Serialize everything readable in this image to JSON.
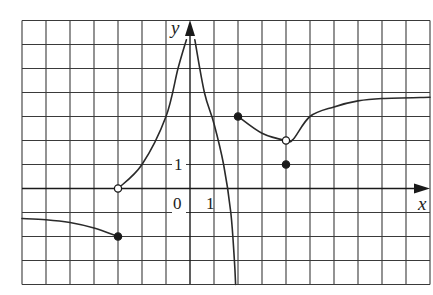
{
  "figure": {
    "type": "function-graph",
    "axes": {
      "x_label": "x",
      "y_label": "y",
      "origin_label": "0",
      "x_tick_label": "1",
      "y_tick_label": "1"
    },
    "grid": {
      "x_range": [
        -7,
        10
      ],
      "y_range": [
        -4,
        7
      ],
      "unit_px": 24,
      "origin_px": [
        190,
        188.5
      ]
    },
    "colors": {
      "grid": "#3a3a3a",
      "curve": "#2a2a2a",
      "background": "#ffffff"
    },
    "pieces": [
      {
        "name": "left-decreasing-branch",
        "domain": "x <= -3",
        "points": [
          [
            -7,
            -1.25
          ],
          [
            -6,
            -1.3
          ],
          [
            -5,
            -1.42
          ],
          [
            -4,
            -1.65
          ],
          [
            -3,
            -2
          ]
        ],
        "right_endpoint": {
          "x": -3,
          "y": -2,
          "type": "closed"
        }
      },
      {
        "name": "rising-branch-to-asymptote",
        "domain": "-3 < x < 0",
        "points": [
          [
            -3,
            0
          ],
          [
            -2,
            1
          ],
          [
            -1,
            3
          ],
          [
            -0.5,
            5
          ],
          [
            -0.15,
            6.2
          ]
        ],
        "left_endpoint": {
          "x": -3,
          "y": 0,
          "type": "open"
        },
        "asymptote": "x = 0"
      },
      {
        "name": "falling-branch-from-asymptote",
        "domain": "0 < x < 2",
        "points": [
          [
            0.2,
            6.2
          ],
          [
            0.6,
            4
          ],
          [
            1,
            2.7
          ],
          [
            1.4,
            1
          ],
          [
            1.7,
            -1
          ],
          [
            1.85,
            -3
          ],
          [
            1.9,
            -4
          ]
        ],
        "asymptote": "x = 0"
      },
      {
        "name": "right-branch-with-hole",
        "domain": "x >= 2",
        "points": [
          [
            2,
            3
          ],
          [
            3,
            2.3
          ],
          [
            4,
            2
          ],
          [
            4.3,
            2.05
          ],
          [
            5,
            3
          ],
          [
            6,
            3.4
          ],
          [
            7,
            3.65
          ],
          [
            8,
            3.75
          ],
          [
            10,
            3.8
          ]
        ],
        "left_endpoint": {
          "x": 2,
          "y": 3,
          "type": "closed"
        },
        "hole": {
          "x": 4,
          "y": 2,
          "type": "open"
        },
        "isolated_point": {
          "x": 4,
          "y": 1,
          "type": "closed"
        },
        "horizontal_asymptote_approx": 3.8
      }
    ],
    "special_points": [
      {
        "x": -3,
        "y": 0,
        "type": "open"
      },
      {
        "x": -3,
        "y": -2,
        "type": "closed"
      },
      {
        "x": 2,
        "y": 3,
        "type": "closed"
      },
      {
        "x": 4,
        "y": 2,
        "type": "open"
      },
      {
        "x": 4,
        "y": 1,
        "type": "closed"
      }
    ]
  }
}
